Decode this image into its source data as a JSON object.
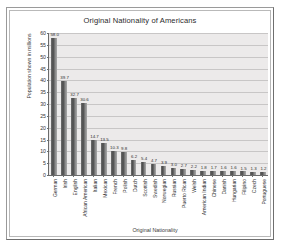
{
  "chart_data": {
    "type": "bar",
    "title": "Original Nationality of Americans",
    "xlabel": "Original Nationality",
    "ylabel": "Population shown in millions",
    "ylim": [
      0,
      60
    ],
    "ytick_step": 5,
    "yticks": [
      60,
      55,
      50,
      45,
      40,
      35,
      30,
      25,
      20,
      15,
      10,
      5,
      0
    ],
    "grid": true,
    "legend": false,
    "bar_color": "#4a4a4a",
    "plot_bg": "#eceaea",
    "categories": [
      "German",
      "Irish",
      "English",
      "African American",
      "Italian",
      "Mexican",
      "French",
      "Polish",
      "Dutch",
      "Scottish",
      "Swedish",
      "Norwegian",
      "Russian",
      "Puerto Rican",
      "Welsh",
      "American Indian",
      "Chinese",
      "Danish",
      "Hungarian",
      "Filipino",
      "Czech",
      "Portuguese"
    ],
    "values": [
      58.0,
      39.7,
      32.7,
      30.6,
      14.7,
      13.5,
      10.3,
      9.8,
      6.2,
      5.4,
      4.7,
      3.9,
      3.0,
      2.7,
      2.2,
      1.8,
      1.7,
      1.6,
      1.6,
      1.5,
      1.3,
      1.2
    ],
    "value_labels": [
      "58.0",
      "39.7",
      "32.7",
      "30.6",
      "14.7",
      "13.5",
      "10.3",
      "9.8",
      "6.2",
      "5.4",
      "4.7",
      "3.9",
      "3.0",
      "2.7",
      "2.2",
      "1.8",
      "1.7",
      "1.6",
      "1.6",
      "1.5",
      "1.3",
      "1.2"
    ]
  }
}
